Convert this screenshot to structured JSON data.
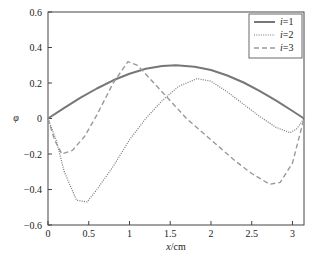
{
  "chart_data": {
    "type": "line",
    "title": "",
    "xlabel": "x /cm",
    "xlabel_italic": "x",
    "xlabel_unit": "/cm",
    "ylabel": "φ",
    "xlim": [
      0,
      3.1416
    ],
    "ylim": [
      -0.6,
      0.6
    ],
    "grid": false,
    "legend_position": "upper right",
    "x_ticks": [
      0,
      0.5,
      1,
      1.5,
      2,
      2.5,
      3
    ],
    "x_tick_labels": [
      "0",
      "0.5",
      "1",
      "1.5",
      "2",
      "2.5",
      "3"
    ],
    "y_ticks": [
      0.6,
      0.4,
      0.2,
      0,
      -0.2,
      -0.4,
      -0.6
    ],
    "y_tick_labels": [
      "0.6",
      "0.4",
      "0.2",
      "0",
      "−0.2",
      "−0.4",
      "−0.6"
    ],
    "series": [
      {
        "name": "i=1",
        "style": "solid",
        "color": "#777777",
        "x": [
          0,
          0.2,
          0.4,
          0.6,
          0.8,
          1.0,
          1.2,
          1.4,
          1.5708,
          1.8,
          2.0,
          2.2,
          2.4,
          2.6,
          2.8,
          3.0,
          3.1416
        ],
        "y": [
          0,
          0.06,
          0.117,
          0.169,
          0.215,
          0.252,
          0.28,
          0.296,
          0.3,
          0.292,
          0.273,
          0.242,
          0.203,
          0.154,
          0.1,
          0.042,
          0
        ]
      },
      {
        "name": "i=2",
        "style": "dotted",
        "color": "#777777",
        "x": [
          0,
          0.1,
          0.2,
          0.35,
          0.48,
          0.6,
          0.8,
          1.0,
          1.2,
          1.4,
          1.6,
          1.83,
          2.0,
          2.2,
          2.4,
          2.6,
          2.8,
          2.97,
          3.05,
          3.1416
        ],
        "y": [
          0,
          -0.12,
          -0.3,
          -0.46,
          -0.47,
          -0.4,
          -0.27,
          -0.12,
          0.0,
          0.1,
          0.18,
          0.225,
          0.21,
          0.15,
          0.08,
          0.01,
          -0.05,
          -0.08,
          -0.06,
          0
        ]
      },
      {
        "name": "i=3",
        "style": "dashed",
        "color": "#999999",
        "x": [
          0,
          0.08,
          0.17,
          0.3,
          0.45,
          0.6,
          0.8,
          0.98,
          1.1,
          1.3,
          1.5,
          1.7,
          1.9,
          2.1,
          2.3,
          2.5,
          2.72,
          2.85,
          3.0,
          3.1416
        ],
        "y": [
          0,
          -0.12,
          -0.2,
          -0.18,
          -0.1,
          0.02,
          0.2,
          0.32,
          0.3,
          0.2,
          0.1,
          0.0,
          -0.08,
          -0.16,
          -0.24,
          -0.31,
          -0.37,
          -0.36,
          -0.25,
          0
        ]
      }
    ]
  },
  "legend": {
    "items": [
      {
        "label_var": "i",
        "label_rest": "=1"
      },
      {
        "label_var": "i",
        "label_rest": "=2"
      },
      {
        "label_var": "i",
        "label_rest": "=3"
      }
    ]
  }
}
